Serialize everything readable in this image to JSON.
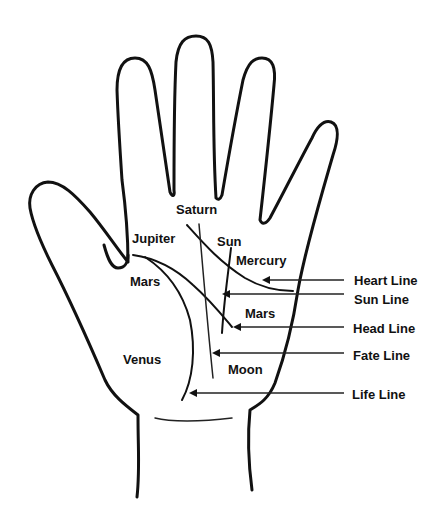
{
  "diagram": {
    "mounts": {
      "saturn": "Saturn",
      "jupiter": "Jupiter",
      "sun": "Sun",
      "mercury": "Mercury",
      "mars_inner": "Mars",
      "mars_outer": "Mars",
      "venus": "Venus",
      "moon": "Moon"
    },
    "lines": {
      "heart": "Heart Line",
      "sun": "Sun Line",
      "head": "Head Line",
      "fate": "Fate Line",
      "life": "Life Line"
    },
    "colors": {
      "stroke": "#111111",
      "background": "#ffffff"
    }
  }
}
